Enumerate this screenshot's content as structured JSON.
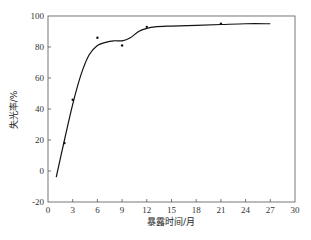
{
  "chart_data": {
    "type": "line",
    "title": "",
    "xlabel": "暴露时间/月",
    "ylabel": "失光率/%",
    "xlim": [
      0,
      30
    ],
    "ylim": [
      -20,
      100
    ],
    "x_ticks": [
      0,
      3,
      6,
      9,
      12,
      15,
      18,
      21,
      24,
      27,
      30
    ],
    "y_ticks": [
      -20,
      0,
      20,
      40,
      60,
      80,
      100
    ],
    "grid": false,
    "legend": null,
    "series": [
      {
        "name": "measured",
        "style": "scatter",
        "x": [
          2,
          3,
          6,
          9,
          12,
          21
        ],
        "y": [
          18,
          46,
          86,
          81,
          93,
          95
        ]
      },
      {
        "name": "fit",
        "style": "line",
        "x": [
          1,
          2,
          3,
          4,
          5,
          6,
          7,
          8,
          9,
          10,
          11,
          12,
          13,
          15,
          18,
          21,
          24,
          27
        ],
        "y": [
          -4,
          20,
          43,
          62,
          75,
          81,
          83,
          84,
          84,
          86,
          90,
          92,
          93,
          93.5,
          94,
          94.5,
          95,
          95
        ]
      }
    ]
  },
  "axes": {
    "xlabel": "暴露时间/月",
    "ylabel": "失光率/%"
  }
}
